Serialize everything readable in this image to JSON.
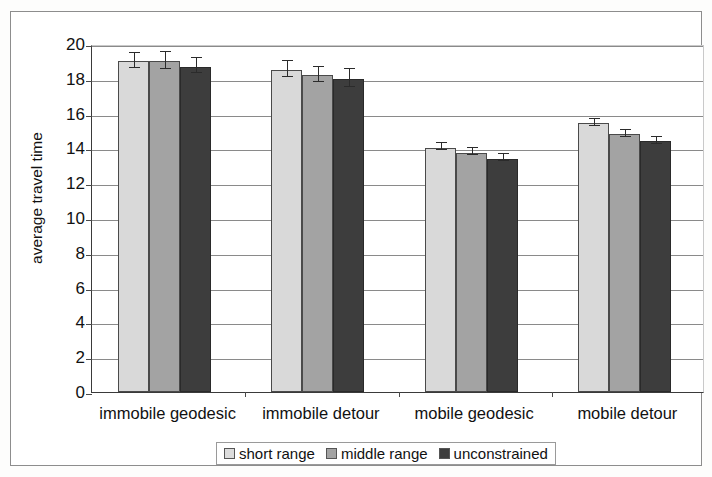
{
  "chart_data": {
    "type": "bar",
    "title": "",
    "xlabel": "",
    "ylabel": "average travel time",
    "ylim": [
      0,
      20
    ],
    "ytick_step": 2,
    "yticks": [
      "0",
      "2",
      "4",
      "6",
      "8",
      "10",
      "12",
      "14",
      "16",
      "18",
      "20"
    ],
    "grid": true,
    "legend_position": "bottom-center",
    "categories": [
      "immobile geodesic",
      "immobile detour",
      "mobile geodesic",
      "mobile detour"
    ],
    "series": [
      {
        "name": "short range",
        "color": "#d9d9d9",
        "values": [
          19.0,
          18.5,
          14.05,
          15.45
        ],
        "errors": [
          0.45,
          0.45,
          0.2,
          0.2
        ]
      },
      {
        "name": "middle range",
        "color": "#a3a3a3",
        "values": [
          19.0,
          18.2,
          13.75,
          14.8
        ],
        "errors": [
          0.5,
          0.45,
          0.2,
          0.2
        ]
      },
      {
        "name": "unconstrained",
        "color": "#3d3d3d",
        "values": [
          18.7,
          18.0,
          13.4,
          14.4
        ],
        "errors": [
          0.45,
          0.5,
          0.2,
          0.2
        ]
      }
    ]
  },
  "axes": {
    "y_title": "average travel time"
  },
  "legend": {
    "items": [
      {
        "label": "short range"
      },
      {
        "label": "middle range"
      },
      {
        "label": "unconstrained"
      }
    ]
  }
}
